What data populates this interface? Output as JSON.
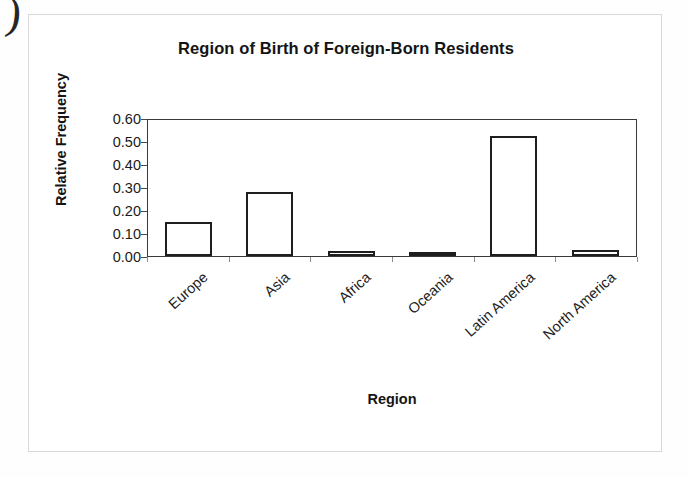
{
  "page": {
    "margin_mark": ")"
  },
  "chart_data": {
    "type": "bar",
    "title": "Region of Birth of Foreign-Born Residents",
    "xlabel": "Region",
    "ylabel": "Relative Frequency",
    "categories": [
      "Europe",
      "Asia",
      "Africa",
      "Oceania",
      "Latin America",
      "North America"
    ],
    "values": [
      0.15,
      0.28,
      0.02,
      0.005,
      0.52,
      0.025
    ],
    "ylim": [
      0.0,
      0.6
    ],
    "ytick_labels": [
      "0.60",
      "0.50",
      "0.40",
      "0.30",
      "0.20",
      "0.10",
      "0.00"
    ],
    "ytick_values": [
      0.6,
      0.5,
      0.4,
      0.3,
      0.2,
      0.1,
      0.0
    ],
    "grid": false,
    "legend": false,
    "bar_fill_color": "#ffffff",
    "bar_border_color": "#1e1e1e",
    "axis_color": "#3a3a3a",
    "text_color": "#141414"
  }
}
